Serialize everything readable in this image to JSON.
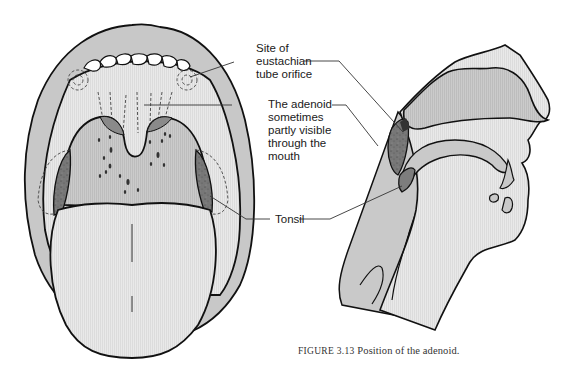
{
  "figure": {
    "number_label": "FIGURE 3.13",
    "caption_text": "Position of the adenoid."
  },
  "labels": {
    "eustachian": "Site of\neustachian\ntube orifice",
    "adenoid": "The adenoid\nsometimes\npartly visible\nthrough the\nmouth",
    "tonsil": "Tonsil"
  },
  "views": {
    "left": "Open mouth (frontal view)",
    "right": "Sagittal section of head"
  },
  "colors": {
    "outline": "#111111",
    "lip": "#c9c9c9",
    "tissue_light": "#e6e6e6",
    "tissue_mid": "#c6c6c6",
    "tonsil_dark": "#7a7a7a",
    "leader_line": "#333333",
    "background": "#ffffff"
  }
}
